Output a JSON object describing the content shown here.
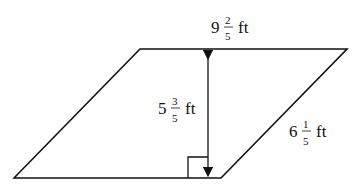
{
  "figure": {
    "type": "parallelogram",
    "labels": {
      "top_base": {
        "whole": "9",
        "num": "2",
        "den": "5",
        "unit": "ft"
      },
      "height": {
        "whole": "5",
        "num": "3",
        "den": "5",
        "unit": "ft"
      },
      "side": {
        "whole": "6",
        "num": "1",
        "den": "5",
        "unit": "ft"
      }
    },
    "colors": {
      "stroke": "#111111",
      "background": "#ffffff"
    }
  }
}
